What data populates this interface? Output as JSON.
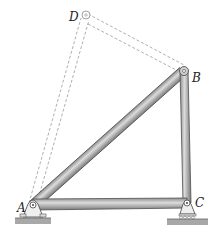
{
  "diagram": {
    "type": "truss",
    "labels": {
      "A": "A",
      "B": "B",
      "C": "C",
      "D": "D"
    },
    "colors": {
      "member_fill": "#b9b9b9",
      "member_edge": "#555555",
      "dashed": "#999999",
      "ground": "#a8a8a8"
    }
  }
}
